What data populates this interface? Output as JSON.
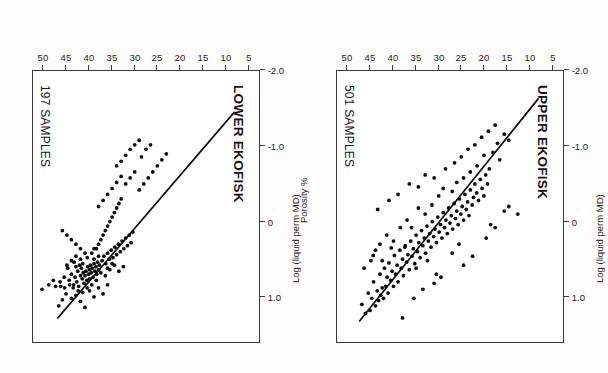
{
  "figure": {
    "orientation": "rotated-180",
    "ink_color": "#0d0d0d",
    "frame_color": "#3a3a3a",
    "axis_title_x": "Porosity %",
    "axis_title_y": "Log (liquid perm MD)"
  },
  "panels": [
    {
      "id": "upper-ekofisk",
      "title": "UPPER EKOFISK",
      "samples_label": "501 SAMPLES"
    },
    {
      "id": "lower-ekofisk",
      "title": "LOWER EKOFISK",
      "samples_label": "197 SAMPLES"
    }
  ],
  "chart_data": [
    {
      "type": "scatter",
      "title": "UPPER EKOFISK",
      "annotations": [
        "501 SAMPLES"
      ],
      "xlabel": "Porosity %",
      "ylabel": "Log (liquid perm MD)",
      "xlim": [
        2.5,
        52.5
      ],
      "ylim": [
        -2.0,
        1.6
      ],
      "xticks": [
        5,
        10,
        15,
        20,
        25,
        30,
        35,
        40,
        45,
        50
      ],
      "xticklabels": [
        "5",
        "10",
        "15",
        "20",
        "25",
        "30",
        "35",
        "40",
        "45",
        "50"
      ],
      "yticks": [
        1.0,
        0,
        -1.0,
        -2.0
      ],
      "yticklabels": [
        "1.0",
        "0",
        "-1.0",
        "-2.0"
      ],
      "grid": false,
      "legend": "none",
      "fit_line": {
        "x": [
          8.0,
          47.5
        ],
        "y": [
          -1.63,
          1.32
        ]
      },
      "points": [
        [
          47.0,
          1.1
        ],
        [
          46.2,
          1.22
        ],
        [
          45.6,
          0.95
        ],
        [
          45.2,
          1.18
        ],
        [
          44.8,
          1.02
        ],
        [
          44.4,
          0.8
        ],
        [
          44.0,
          1.12
        ],
        [
          43.6,
          0.92
        ],
        [
          43.3,
          1.05
        ],
        [
          43.0,
          0.7
        ],
        [
          42.8,
          0.98
        ],
        [
          42.5,
          0.88
        ],
        [
          42.2,
          1.02
        ],
        [
          42.0,
          0.62
        ],
        [
          41.7,
          0.86
        ],
        [
          41.4,
          0.74
        ],
        [
          41.2,
          0.95
        ],
        [
          41.0,
          0.55
        ],
        [
          40.6,
          0.78
        ],
        [
          40.3,
          0.66
        ],
        [
          40.0,
          0.86
        ],
        [
          39.8,
          0.45
        ],
        [
          39.5,
          0.7
        ],
        [
          39.2,
          0.58
        ],
        [
          39.0,
          0.8
        ],
        [
          38.6,
          0.38
        ],
        [
          38.3,
          0.62
        ],
        [
          38.0,
          0.5
        ],
        [
          37.8,
          0.72
        ],
        [
          37.4,
          0.32
        ],
        [
          37.1,
          0.54
        ],
        [
          36.8,
          0.44
        ],
        [
          36.5,
          0.64
        ],
        [
          36.2,
          0.26
        ],
        [
          35.9,
          0.46
        ],
        [
          35.6,
          0.36
        ],
        [
          35.3,
          0.56
        ],
        [
          35.0,
          0.18
        ],
        [
          34.7,
          0.4
        ],
        [
          34.4,
          0.28
        ],
        [
          34.1,
          0.48
        ],
        [
          33.8,
          0.12
        ],
        [
          33.5,
          0.32
        ],
        [
          33.2,
          0.22
        ],
        [
          32.9,
          0.42
        ],
        [
          32.6,
          0.06
        ],
        [
          32.3,
          0.26
        ],
        [
          32.0,
          0.16
        ],
        [
          31.7,
          0.34
        ],
        [
          31.4,
          0.0
        ],
        [
          31.1,
          0.2
        ],
        [
          30.8,
          0.1
        ],
        [
          30.5,
          0.28
        ],
        [
          30.2,
          -0.06
        ],
        [
          29.9,
          0.14
        ],
        [
          29.6,
          0.04
        ],
        [
          29.3,
          0.22
        ],
        [
          29.0,
          -0.12
        ],
        [
          28.7,
          0.08
        ],
        [
          28.4,
          -0.02
        ],
        [
          28.1,
          0.16
        ],
        [
          27.8,
          -0.18
        ],
        [
          27.5,
          0.02
        ],
        [
          27.2,
          -0.08
        ],
        [
          26.9,
          0.1
        ],
        [
          26.6,
          -0.24
        ],
        [
          26.3,
          -0.04
        ],
        [
          26.0,
          -0.14
        ],
        [
          25.7,
          0.04
        ],
        [
          25.4,
          -0.3
        ],
        [
          25.1,
          -0.1
        ],
        [
          24.8,
          -0.2
        ],
        [
          24.5,
          -0.02
        ],
        [
          24.2,
          -0.36
        ],
        [
          23.9,
          -0.16
        ],
        [
          23.6,
          -0.26
        ],
        [
          23.3,
          -0.08
        ],
        [
          23.0,
          -0.42
        ],
        [
          22.6,
          -0.22
        ],
        [
          22.3,
          -0.32
        ],
        [
          22.0,
          -0.5
        ],
        [
          21.6,
          -0.38
        ],
        [
          21.2,
          -0.28
        ],
        [
          20.8,
          -0.56
        ],
        [
          20.4,
          -0.44
        ],
        [
          20.0,
          -0.34
        ],
        [
          19.6,
          -0.62
        ],
        [
          19.2,
          -0.5
        ],
        [
          18.8,
          -0.7
        ],
        [
          44.5,
          0.45
        ],
        [
          43.0,
          0.3
        ],
        [
          41.5,
          0.18
        ],
        [
          40.5,
          0.35
        ],
        [
          38.5,
          0.08
        ],
        [
          37.0,
          -0.02
        ],
        [
          36.0,
          0.08
        ],
        [
          34.5,
          -0.18
        ],
        [
          33.0,
          -0.1
        ],
        [
          31.5,
          -0.22
        ],
        [
          30.0,
          -0.34
        ],
        [
          29.0,
          -0.44
        ],
        [
          27.0,
          -0.4
        ],
        [
          26.0,
          -0.52
        ],
        [
          24.5,
          -0.58
        ],
        [
          23.0,
          -0.66
        ],
        [
          21.5,
          -0.74
        ],
        [
          20.0,
          -0.88
        ],
        [
          18.0,
          -0.92
        ],
        [
          17.0,
          -1.04
        ],
        [
          16.5,
          -0.82
        ],
        [
          15.5,
          -1.16
        ],
        [
          14.5,
          -1.08
        ],
        [
          38.0,
          1.28
        ],
        [
          35.5,
          1.02
        ],
        [
          33.5,
          0.9
        ],
        [
          31.0,
          0.82
        ],
        [
          30.5,
          0.7
        ],
        [
          29.5,
          0.74
        ],
        [
          24.5,
          0.58
        ],
        [
          22.5,
          0.46
        ],
        [
          19.5,
          0.22
        ],
        [
          18.5,
          0.04
        ],
        [
          17.5,
          0.08
        ],
        [
          15.5,
          -0.14
        ],
        [
          14.5,
          -0.2
        ],
        [
          12.5,
          -0.1
        ],
        [
          27.0,
          0.42
        ],
        [
          25.5,
          0.3
        ],
        [
          43.5,
          -0.16
        ],
        [
          41.0,
          -0.28
        ],
        [
          39.0,
          -0.36
        ],
        [
          36.5,
          -0.5
        ],
        [
          34.5,
          -0.46
        ],
        [
          33.0,
          -0.62
        ],
        [
          31.0,
          -0.58
        ],
        [
          28.5,
          -0.7
        ],
        [
          26.5,
          -0.78
        ],
        [
          25.0,
          -0.86
        ],
        [
          23.5,
          -0.96
        ],
        [
          22.0,
          -1.02
        ],
        [
          20.5,
          -1.12
        ],
        [
          19.0,
          -1.2
        ],
        [
          17.5,
          -1.28
        ],
        [
          46.5,
          0.62
        ],
        [
          45.0,
          0.52
        ],
        [
          44.0,
          0.38
        ],
        [
          42.5,
          0.52
        ],
        [
          40.0,
          0.26
        ],
        [
          37.5,
          0.34
        ],
        [
          35.0,
          0.62
        ],
        [
          32.5,
          0.52
        ]
      ]
    },
    {
      "type": "scatter",
      "title": "LOWER EKOFISK",
      "annotations": [
        "197 SAMPLES"
      ],
      "xlabel": "Porosity %",
      "ylabel": "Log (liquid perm MD)",
      "xlim": [
        2.5,
        52.5
      ],
      "ylim": [
        -2.0,
        1.6
      ],
      "xticks": [
        5,
        10,
        15,
        20,
        25,
        30,
        35,
        40,
        45,
        50
      ],
      "xticklabels": [
        "5",
        "10",
        "15",
        "20",
        "25",
        "30",
        "35",
        "40",
        "45",
        "50"
      ],
      "yticks": [
        1.0,
        0,
        -1.0,
        -2.0
      ],
      "yticklabels": [
        "1.0",
        "0",
        "-1.0",
        "-2.0"
      ],
      "grid": false,
      "legend": "none",
      "fit_line": {
        "x": [
          8.0,
          47.0
        ],
        "y": [
          -1.45,
          1.28
        ]
      },
      "points": [
        [
          41.0,
          0.72
        ],
        [
          40.8,
          0.66
        ],
        [
          40.6,
          0.78
        ],
        [
          40.4,
          0.6
        ],
        [
          40.2,
          0.7
        ],
        [
          40.0,
          0.64
        ],
        [
          40.0,
          0.76
        ],
        [
          39.8,
          0.58
        ],
        [
          39.6,
          0.68
        ],
        [
          39.4,
          0.62
        ],
        [
          39.2,
          0.74
        ],
        [
          39.0,
          0.56
        ],
        [
          38.8,
          0.66
        ],
        [
          38.6,
          0.6
        ],
        [
          38.4,
          0.7
        ],
        [
          38.2,
          0.54
        ],
        [
          38.0,
          0.64
        ],
        [
          37.8,
          0.58
        ],
        [
          41.2,
          0.82
        ],
        [
          41.4,
          0.68
        ],
        [
          41.6,
          0.76
        ],
        [
          41.8,
          0.62
        ],
        [
          42.0,
          0.72
        ],
        [
          42.2,
          0.58
        ],
        [
          42.4,
          0.86
        ],
        [
          42.6,
          0.66
        ],
        [
          42.8,
          0.8
        ],
        [
          43.0,
          0.6
        ],
        [
          43.2,
          0.74
        ],
        [
          43.4,
          0.54
        ],
        [
          43.6,
          0.88
        ],
        [
          44.0,
          0.7
        ],
        [
          44.4,
          0.84
        ],
        [
          44.8,
          0.62
        ],
        [
          45.2,
          0.96
        ],
        [
          45.6,
          0.74
        ],
        [
          46.0,
          1.04
        ],
        [
          46.4,
          0.86
        ],
        [
          46.8,
          1.12
        ],
        [
          44.0,
          1.02
        ],
        [
          43.0,
          0.98
        ],
        [
          42.0,
          1.06
        ],
        [
          41.0,
          1.14
        ],
        [
          40.0,
          0.92
        ],
        [
          39.0,
          1.0
        ],
        [
          38.0,
          0.88
        ],
        [
          37.0,
          0.96
        ],
        [
          36.0,
          0.84
        ],
        [
          37.2,
          0.52
        ],
        [
          36.8,
          0.46
        ],
        [
          36.4,
          0.56
        ],
        [
          36.0,
          0.42
        ],
        [
          35.6,
          0.5
        ],
        [
          35.2,
          0.38
        ],
        [
          34.8,
          0.48
        ],
        [
          34.4,
          0.34
        ],
        [
          34.0,
          0.44
        ],
        [
          33.6,
          0.3
        ],
        [
          33.2,
          0.4
        ],
        [
          32.8,
          0.26
        ],
        [
          32.4,
          0.36
        ],
        [
          32.0,
          0.22
        ],
        [
          31.6,
          0.32
        ],
        [
          31.2,
          0.18
        ],
        [
          30.8,
          0.28
        ],
        [
          30.4,
          0.14
        ],
        [
          38.5,
          0.36
        ],
        [
          38.0,
          0.3
        ],
        [
          37.5,
          0.24
        ],
        [
          37.0,
          0.18
        ],
        [
          36.5,
          0.12
        ],
        [
          36.0,
          0.06
        ],
        [
          35.5,
          0.0
        ],
        [
          35.0,
          -0.06
        ],
        [
          34.5,
          -0.12
        ],
        [
          34.0,
          -0.18
        ],
        [
          33.5,
          -0.24
        ],
        [
          33.0,
          -0.3
        ],
        [
          39.5,
          0.42
        ],
        [
          39.0,
          0.36
        ],
        [
          40.5,
          0.48
        ],
        [
          41.0,
          0.42
        ],
        [
          42.0,
          0.36
        ],
        [
          43.0,
          0.3
        ],
        [
          44.0,
          0.24
        ],
        [
          45.0,
          0.18
        ],
        [
          46.0,
          0.12
        ],
        [
          41.5,
          0.94
        ],
        [
          42.5,
          0.92
        ],
        [
          43.5,
          0.84
        ],
        [
          44.5,
          0.78
        ],
        [
          45.5,
          0.88
        ],
        [
          46.5,
          0.8
        ],
        [
          47.5,
          0.86
        ],
        [
          48.0,
          0.78
        ],
        [
          49.0,
          0.84
        ],
        [
          50.5,
          0.9
        ],
        [
          38.0,
          -0.2
        ],
        [
          37.0,
          -0.28
        ],
        [
          36.0,
          -0.36
        ],
        [
          35.0,
          -0.44
        ],
        [
          34.0,
          -0.52
        ],
        [
          33.0,
          -0.6
        ],
        [
          32.0,
          -0.5
        ],
        [
          31.0,
          -0.58
        ],
        [
          30.0,
          -0.66
        ],
        [
          29.0,
          -0.42
        ],
        [
          28.0,
          -0.5
        ],
        [
          27.0,
          -0.58
        ],
        [
          26.0,
          -0.66
        ],
        [
          25.0,
          -0.74
        ],
        [
          24.0,
          -0.82
        ],
        [
          23.0,
          -0.9
        ],
        [
          34.0,
          -0.74
        ],
        [
          33.0,
          -0.8
        ],
        [
          32.0,
          -0.88
        ],
        [
          31.0,
          -0.96
        ],
        [
          30.0,
          -1.02
        ],
        [
          29.0,
          -1.08
        ],
        [
          27.5,
          -0.96
        ],
        [
          26.5,
          -1.02
        ],
        [
          28.5,
          -0.86
        ],
        [
          44.0,
          0.52
        ],
        [
          45.0,
          0.58
        ],
        [
          43.0,
          0.46
        ],
        [
          42.0,
          0.5
        ],
        [
          39.5,
          0.84
        ],
        [
          38.5,
          0.78
        ],
        [
          40.5,
          0.88
        ],
        [
          41.5,
          0.56
        ],
        [
          37.5,
          0.68
        ],
        [
          36.5,
          0.72
        ],
        [
          35.5,
          0.64
        ],
        [
          34.5,
          0.58
        ],
        [
          33.5,
          0.66
        ],
        [
          32.5,
          0.6
        ],
        [
          36.0,
          0.62
        ],
        [
          35.0,
          0.56
        ],
        [
          38.0,
          0.46
        ],
        [
          39.0,
          0.5
        ]
      ]
    }
  ]
}
